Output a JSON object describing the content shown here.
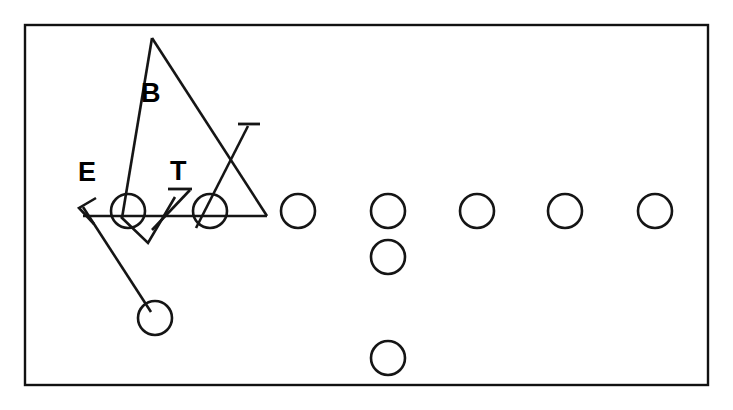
{
  "diagram": {
    "type": "football-play-diagram",
    "canvas": {
      "width": 733,
      "height": 410
    },
    "colors": {
      "ink": "#151515",
      "border": "#111111",
      "background": "#ffffff"
    },
    "border": {
      "x": 25,
      "y": 25,
      "width": 683,
      "height": 360,
      "stroke_width": 2.4
    },
    "labels": [
      {
        "id": "label-E",
        "text": "E",
        "x": 78,
        "y": 181,
        "meaning": "defensive-end"
      },
      {
        "id": "label-B",
        "text": "B",
        "x": 141,
        "y": 102,
        "meaning": "linebacker"
      },
      {
        "id": "label-T",
        "text": "T",
        "x": 170,
        "y": 180,
        "meaning": "defensive-tackle"
      }
    ],
    "offense_line": {
      "note": "offensive line circles along the line of scrimmage",
      "radius": 17,
      "y": 211,
      "centers_x": [
        128,
        210,
        298,
        388,
        477,
        565,
        655
      ]
    },
    "backfield": [
      {
        "id": "back-middle",
        "cx": 388,
        "cy": 257,
        "r": 17
      },
      {
        "id": "back-deep",
        "cx": 388,
        "cy": 358,
        "r": 17
      },
      {
        "id": "back-left",
        "cx": 155,
        "cy": 318,
        "r": 17
      }
    ],
    "routes": [
      {
        "id": "route-backer-B",
        "meaning": "linebacker blitz path",
        "points": [
          [
            152,
            38
          ],
          [
            122,
            218
          ]
        ]
      },
      {
        "id": "route-backer-B-right",
        "meaning": "linebacker loop to right",
        "points": [
          [
            152,
            38
          ],
          [
            267,
            216
          ]
        ]
      },
      {
        "id": "route-line-of-scrimmage",
        "meaning": "horizontal stunt path across line",
        "points": [
          [
            83,
            216
          ],
          [
            267,
            216
          ]
        ]
      },
      {
        "id": "route-V",
        "meaning": "down and back V path",
        "points": [
          [
            121,
            217
          ],
          [
            148,
            243
          ],
          [
            175,
            197
          ]
        ]
      },
      {
        "id": "route-tackle-T",
        "meaning": "tackle slant with bar terminator",
        "points": [
          [
            152,
            230
          ],
          [
            190,
            190
          ]
        ]
      },
      {
        "id": "route-end-cross",
        "meaning": "end crossing path up to right",
        "points": [
          [
            196,
            228
          ],
          [
            248,
            126
          ]
        ]
      },
      {
        "id": "route-back-left",
        "meaning": "back motion to left arrow",
        "points": [
          [
            151,
            312
          ],
          [
            83,
            207
          ]
        ]
      }
    ],
    "terminators": [
      {
        "id": "cap-tackle",
        "type": "bar",
        "x1": 168,
        "y1": 189,
        "x2": 192,
        "y2": 189
      },
      {
        "id": "cap-end",
        "type": "bar",
        "x1": 238,
        "y1": 124,
        "x2": 260,
        "y2": 124
      },
      {
        "id": "arrow-left",
        "type": "arrowhead",
        "tip": [
          79,
          208
        ],
        "wing1": [
          96,
          198
        ],
        "wing2": [
          94,
          224
        ]
      }
    ]
  }
}
